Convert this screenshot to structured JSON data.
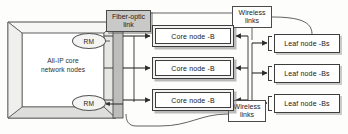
{
  "diagram": {
    "colors": {
      "grey_fill": "#c9c9c7",
      "box_fill": "#f2f2f0",
      "stroke": "#3d3d3d",
      "background": "#fdfdfc"
    },
    "core_network": {
      "label": "All-IP core\nnetwork nodes",
      "label_line1": "All-IP core",
      "label_line2": "network nodes",
      "managers": [
        {
          "id": "rm-top",
          "label": "RM"
        },
        {
          "id": "rm-bottom",
          "label": "RM"
        }
      ]
    },
    "link_labels": [
      {
        "id": "fiber-optic-link",
        "line1": "Fiber-optic",
        "line2": "link",
        "style": "grey"
      },
      {
        "id": "wireless-links-top",
        "line1": "Wireless",
        "line2": "links",
        "style": "white"
      },
      {
        "id": "wireless-links-bottom",
        "line1": "Wireless",
        "line2": "links",
        "style": "white"
      }
    ],
    "core_nodes": [
      {
        "label": "Core node -B"
      },
      {
        "label": "Core node -B"
      },
      {
        "label": "Core node -B"
      }
    ],
    "leaf_nodes": [
      {
        "label": "Leaf node -Bs"
      },
      {
        "label": "Leaf node -Bs"
      },
      {
        "label": "Leaf node -Bs"
      }
    ]
  }
}
